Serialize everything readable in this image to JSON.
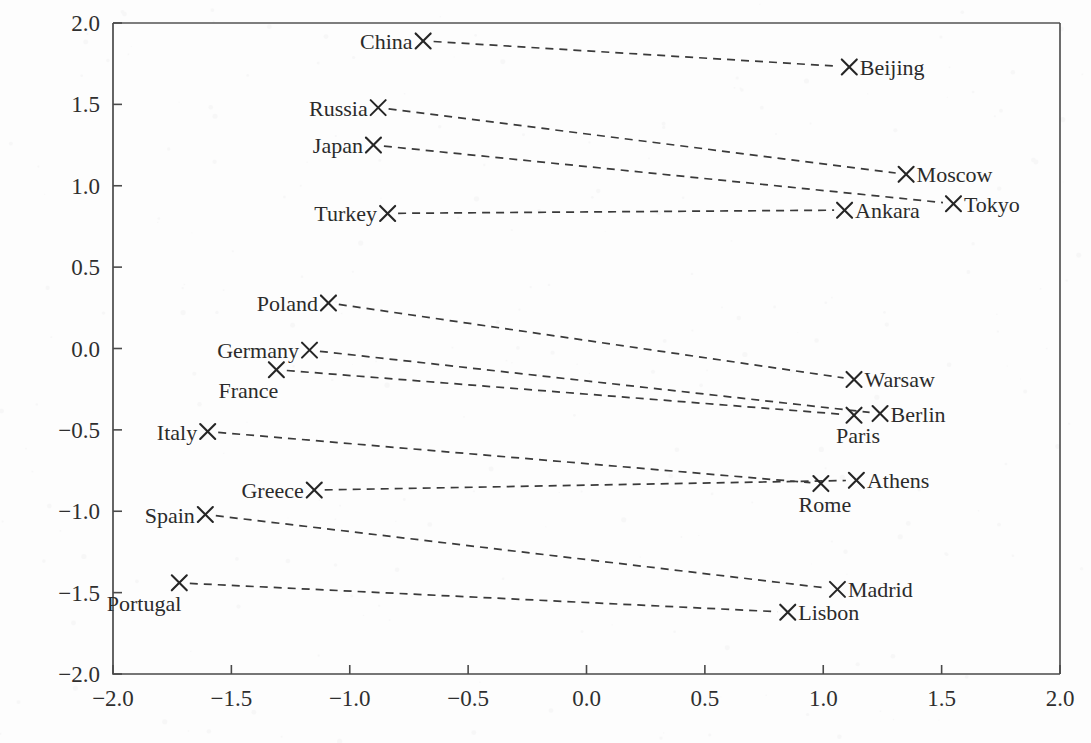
{
  "chart_data": {
    "type": "scatter",
    "title": "",
    "xlabel": "",
    "ylabel": "",
    "xlim": [
      -2.0,
      2.0
    ],
    "ylim": [
      -2.0,
      2.0
    ],
    "grid": false,
    "legend": "none",
    "xticks": [
      "-2.0",
      "-1.5",
      "-1.0",
      "-0.5",
      "0.0",
      "0.5",
      "1.0",
      "1.5",
      "2.0"
    ],
    "xtick_values": [
      -2.0,
      -1.5,
      -1.0,
      -0.5,
      0.0,
      0.5,
      1.0,
      1.5,
      2.0
    ],
    "yticks": [
      "-2.0",
      "-1.5",
      "-1.0",
      "-0.5",
      "0.0",
      "0.5",
      "1.0",
      "1.5",
      "2.0"
    ],
    "ytick_values": [
      -2.0,
      -1.5,
      -1.0,
      -0.5,
      0.0,
      0.5,
      1.0,
      1.5,
      2.0
    ],
    "marker_style": "x",
    "connector_style": "dashed",
    "pairs": [
      {
        "country": "China",
        "capital": "Beijing",
        "country_x": -0.69,
        "country_y": 1.89,
        "capital_x": 1.11,
        "capital_y": 1.73,
        "country_label_side": "left",
        "capital_label_side": "right"
      },
      {
        "country": "Russia",
        "capital": "Moscow",
        "country_x": -0.88,
        "country_y": 1.48,
        "capital_x": 1.35,
        "capital_y": 1.07,
        "country_label_side": "left",
        "capital_label_side": "right"
      },
      {
        "country": "Japan",
        "capital": "Tokyo",
        "country_x": -0.9,
        "country_y": 1.25,
        "capital_x": 1.55,
        "capital_y": 0.89,
        "country_label_side": "left",
        "capital_label_side": "right"
      },
      {
        "country": "Turkey",
        "capital": "Ankara",
        "country_x": -0.84,
        "country_y": 0.83,
        "capital_x": 1.09,
        "capital_y": 0.85,
        "country_label_side": "left",
        "capital_label_side": "right"
      },
      {
        "country": "Poland",
        "capital": "Warsaw",
        "country_x": -1.09,
        "country_y": 0.28,
        "capital_x": 1.13,
        "capital_y": -0.19,
        "country_label_side": "left",
        "capital_label_side": "right"
      },
      {
        "country": "Germany",
        "capital": "Berlin",
        "country_x": -1.17,
        "country_y": -0.01,
        "capital_x": 1.24,
        "capital_y": -0.4,
        "country_label_side": "left",
        "capital_label_side": "right"
      },
      {
        "country": "France",
        "capital": "Paris",
        "country_x": -1.31,
        "country_y": -0.13,
        "capital_x": 1.13,
        "capital_y": -0.41,
        "country_label_side": "below-left",
        "capital_label_side": "below"
      },
      {
        "country": "Italy",
        "capital": "Rome",
        "country_x": -1.6,
        "country_y": -0.51,
        "capital_x": 0.99,
        "capital_y": -0.83,
        "country_label_side": "left",
        "capital_label_side": "below"
      },
      {
        "country": "Greece",
        "capital": "Athens",
        "country_x": -1.15,
        "country_y": -0.87,
        "capital_x": 1.14,
        "capital_y": -0.81,
        "country_label_side": "left",
        "capital_label_side": "right"
      },
      {
        "country": "Spain",
        "capital": "Madrid",
        "country_x": -1.61,
        "country_y": -1.02,
        "capital_x": 1.06,
        "capital_y": -1.48,
        "country_label_side": "left",
        "capital_label_side": "right"
      },
      {
        "country": "Portugal",
        "capital": "Lisbon",
        "country_x": -1.72,
        "country_y": -1.44,
        "capital_x": 0.85,
        "capital_y": -1.62,
        "country_label_side": "below-left",
        "capital_label_side": "right"
      }
    ]
  },
  "colors": {
    "background": "#fdfdfd",
    "axis": "#4a4a4a",
    "text": "#2b2b2b",
    "connector": "#3a3a3a",
    "marker": "#262626"
  }
}
